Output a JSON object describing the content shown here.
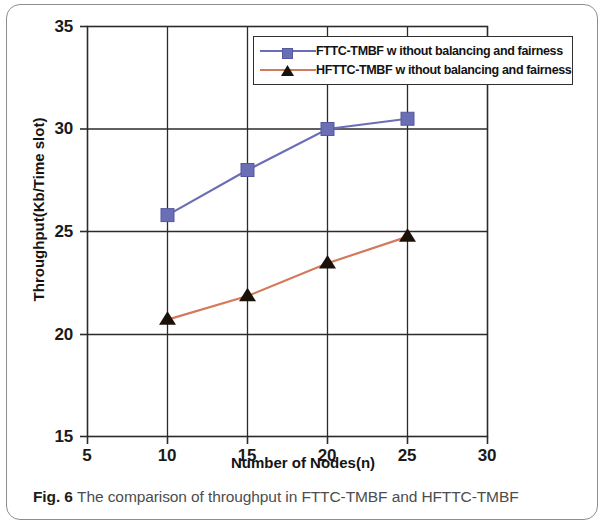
{
  "figure": {
    "caption_label": "Fig. 6",
    "caption_text": "The comparison of throughput in FTTC-TMBF and HFTTC-TMBF"
  },
  "chart_data": {
    "type": "line",
    "title": "",
    "xlabel": "Number of Nodes(n)",
    "ylabel": "Throughput(Kb/Time slot)",
    "xlim": [
      5,
      30
    ],
    "ylim": [
      15,
      35
    ],
    "xticks": [
      5,
      10,
      15,
      20,
      25,
      30
    ],
    "yticks": [
      15,
      20,
      25,
      30,
      35
    ],
    "xtick_labels": [
      "5",
      "10",
      "15",
      "20",
      "25",
      "30"
    ],
    "ytick_labels": [
      "15",
      "20",
      "25",
      "30",
      "35"
    ],
    "grid": true,
    "legend_position": "top-right",
    "x": [
      10,
      15,
      20,
      25
    ],
    "series": [
      {
        "name": "FTTC-TMBF w ithout balancing and fairness",
        "marker": "square",
        "color": "#6a6fb5",
        "marker_color": "#6a6fb5",
        "values": [
          25.8,
          28.0,
          30.0,
          30.5
        ]
      },
      {
        "name": "HFTTC-TMBF w ithout balancing and fairness",
        "marker": "triangle",
        "color": "#d4795c",
        "marker_color": "#1a1208",
        "values": [
          20.7,
          21.85,
          23.45,
          24.75
        ]
      }
    ]
  }
}
